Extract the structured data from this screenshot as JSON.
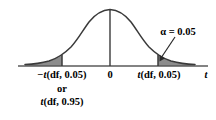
{
  "figure": {
    "colors": {
      "curve": "#3a3a3a",
      "axis": "#4a4a4a",
      "shade_fill": "#8c8c8c",
      "text": "#000000",
      "background": "#ffffff"
    }
  },
  "labels": {
    "left_critical": "−t(df, 0.05)",
    "or": "or",
    "left_alternate": "t(df, 0.95)",
    "center": "0",
    "right_critical": "t(df, 0.05)",
    "axis_variable": "t",
    "alpha_annotation": "α = 0.05"
  },
  "chart_data": {
    "type": "line",
    "xlabel": "t",
    "ylabel": "",
    "grid": false,
    "legend": null,
    "xlim": [
      -4.0,
      4.0
    ],
    "ylim": [
      0,
      0.4
    ],
    "curve": {
      "name": "Student t density",
      "x": [
        -4.0,
        -3.6,
        -3.2,
        -2.8,
        -2.4,
        -2.0,
        -1.8,
        -1.6,
        -1.2,
        -0.8,
        -0.4,
        0.0,
        0.4,
        0.8,
        1.2,
        1.6,
        1.8,
        2.0,
        2.4,
        2.8,
        3.2,
        3.6,
        4.0
      ],
      "y": [
        0.007,
        0.01,
        0.015,
        0.022,
        0.035,
        0.054,
        0.068,
        0.085,
        0.132,
        0.194,
        0.258,
        0.283,
        0.258,
        0.194,
        0.132,
        0.085,
        0.068,
        0.054,
        0.035,
        0.022,
        0.015,
        0.01,
        0.007
      ]
    },
    "annotations": [
      {
        "text": "α = 0.05",
        "x": 2.9,
        "y": 0.28,
        "arrow_to_x": 2.05,
        "arrow_to_y": 0.05
      }
    ],
    "shaded_regions": [
      {
        "name": "left-tail",
        "from_x": -4.0,
        "to_x": -1.8,
        "area": 0.05,
        "fill": "#8c8c8c"
      },
      {
        "name": "right-tail",
        "from_x": 1.8,
        "to_x": 4.0,
        "area": 0.05,
        "fill": "#8c8c8c"
      }
    ],
    "vertical_lines": [
      {
        "name": "left-critical",
        "x": -1.8
      },
      {
        "name": "center",
        "x": 0.0
      },
      {
        "name": "right-critical",
        "x": 1.8
      }
    ],
    "tick_labels": [
      {
        "x": -1.8,
        "label": "−t(df, 0.05)"
      },
      {
        "x": 0.0,
        "label": "0"
      },
      {
        "x": 1.8,
        "label": "t(df, 0.05)"
      }
    ]
  }
}
